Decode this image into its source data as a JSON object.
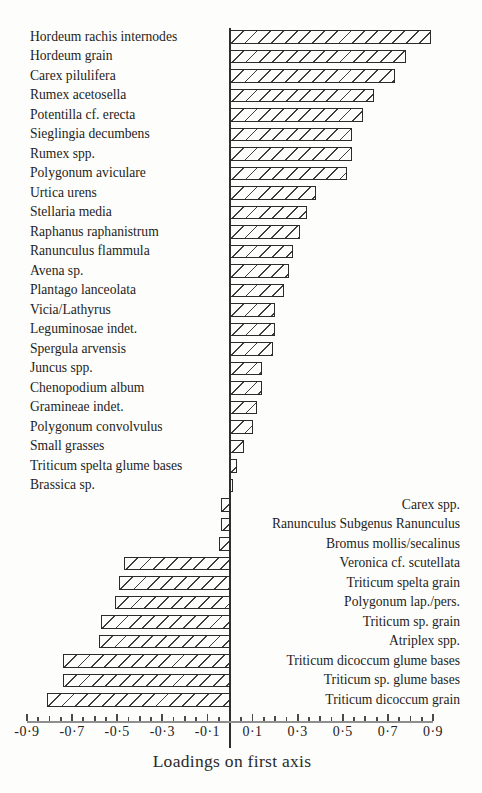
{
  "chart_data": {
    "type": "bar",
    "orientation": "horizontal",
    "title": "",
    "xlabel": "Loadings on first axis",
    "ylabel": "",
    "xlim": [
      -0.9,
      0.9
    ],
    "grid": false,
    "hatch_style": "diagonal-forward-slash",
    "colors": {
      "bar_fill": "#fdfdfb",
      "hatch_line": "#3d3d3d",
      "bar_border": "#2b2b2b",
      "axis_line": "#8f8f8f",
      "zero_line": "#2e2e2e",
      "text": "#1d1d1d",
      "background": "#fdfdfb"
    },
    "axis_ticks": {
      "minor_step": 0.05,
      "major_labeled": [
        {
          "value": -0.9,
          "text": "-0·9"
        },
        {
          "value": -0.7,
          "text": "-0·7"
        },
        {
          "value": -0.5,
          "text": "-0·5"
        },
        {
          "value": -0.3,
          "text": "-0·3"
        },
        {
          "value": -0.1,
          "text": "-0·1"
        },
        {
          "value": 0.1,
          "text": "0·1"
        },
        {
          "value": 0.3,
          "text": "0·3"
        },
        {
          "value": 0.5,
          "text": "0·5"
        },
        {
          "value": 0.7,
          "text": "0·7"
        },
        {
          "value": 0.9,
          "text": "0·9"
        }
      ]
    },
    "rows": [
      {
        "label": "Hordeum rachis internodes",
        "value": 0.89,
        "label_side": "left"
      },
      {
        "label": "Hordeum grain",
        "value": 0.78,
        "label_side": "left"
      },
      {
        "label": "Carex pilulifera",
        "value": 0.73,
        "label_side": "left"
      },
      {
        "label": "Rumex acetosella",
        "value": 0.64,
        "label_side": "left"
      },
      {
        "label": "Potentilla cf. erecta",
        "value": 0.59,
        "label_side": "left"
      },
      {
        "label": "Sieglingia decumbens",
        "value": 0.54,
        "label_side": "left"
      },
      {
        "label": "Rumex spp.",
        "value": 0.54,
        "label_side": "left"
      },
      {
        "label": "Polygonum aviculare",
        "value": 0.52,
        "label_side": "left"
      },
      {
        "label": "Urtica urens",
        "value": 0.38,
        "label_side": "left"
      },
      {
        "label": "Stellaria media",
        "value": 0.34,
        "label_side": "left"
      },
      {
        "label": "Raphanus raphanistrum",
        "value": 0.31,
        "label_side": "left"
      },
      {
        "label": "Ranunculus flammula",
        "value": 0.28,
        "label_side": "left"
      },
      {
        "label": "Avena sp.",
        "value": 0.26,
        "label_side": "left"
      },
      {
        "label": "Plantago lanceolata",
        "value": 0.24,
        "label_side": "left"
      },
      {
        "label": "Vicia/Lathyrus",
        "value": 0.2,
        "label_side": "left"
      },
      {
        "label": "Leguminosae indet.",
        "value": 0.2,
        "label_side": "left"
      },
      {
        "label": "Spergula arvensis",
        "value": 0.19,
        "label_side": "left"
      },
      {
        "label": "Juncus spp.",
        "value": 0.14,
        "label_side": "left"
      },
      {
        "label": "Chenopodium album",
        "value": 0.14,
        "label_side": "left"
      },
      {
        "label": "Gramineae indet.",
        "value": 0.12,
        "label_side": "left"
      },
      {
        "label": "Polygonum convolvulus",
        "value": 0.1,
        "label_side": "left"
      },
      {
        "label": "Small grasses",
        "value": 0.06,
        "label_side": "left"
      },
      {
        "label": "Triticum spelta glume bases",
        "value": 0.03,
        "label_side": "left"
      },
      {
        "label": "Brassica sp.",
        "value": 0.015,
        "label_side": "left"
      },
      {
        "label": "Carex spp.",
        "value": -0.04,
        "label_side": "right"
      },
      {
        "label": "Ranunculus Subgenus Ranunculus",
        "value": -0.04,
        "label_side": "right"
      },
      {
        "label": "Bromus mollis/secalinus",
        "value": -0.05,
        "label_side": "right"
      },
      {
        "label": "Veronica cf. scutellata",
        "value": -0.47,
        "label_side": "right"
      },
      {
        "label": "Triticum spelta grain",
        "value": -0.49,
        "label_side": "right"
      },
      {
        "label": "Polygonum lap./pers.",
        "value": -0.51,
        "label_side": "right"
      },
      {
        "label": "Triticum sp. grain",
        "value": -0.57,
        "label_side": "right"
      },
      {
        "label": "Atriplex spp.",
        "value": -0.58,
        "label_side": "right"
      },
      {
        "label": "Triticum dicoccum glume bases",
        "value": -0.74,
        "label_side": "right"
      },
      {
        "label": "Triticum sp. glume bases",
        "value": -0.74,
        "label_side": "right"
      },
      {
        "label": "Triticum dicoccum grain",
        "value": -0.81,
        "label_side": "right"
      }
    ]
  }
}
